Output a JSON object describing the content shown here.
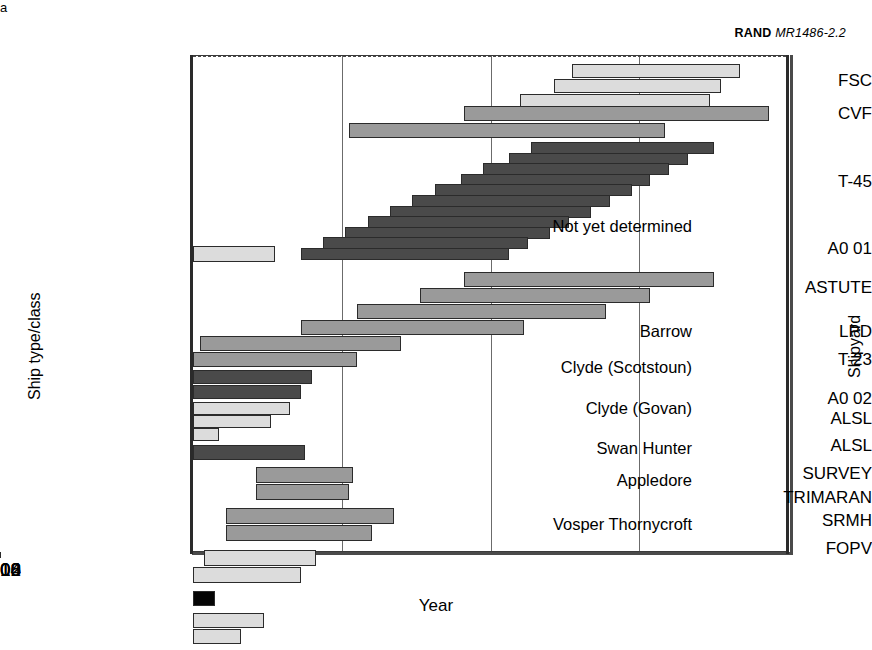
{
  "credit": {
    "org": "RAND",
    "doc": "MR1486-2.2"
  },
  "axes": {
    "x_title": "Year",
    "y_title_left": "Ship type/class",
    "y_title_right": "Shipyard",
    "x_ticks": [
      "2000",
      "2004",
      "2008",
      "2012",
      "2016"
    ],
    "x_min": 2000,
    "x_max": 2016
  },
  "footnote_marker": "a",
  "ship_classes": [
    "FSC",
    "CVF",
    "T-45",
    "A0 01",
    "ASTUTE",
    "LPD",
    "T-23",
    "A0 02",
    "ALSL",
    "ALSL",
    "SURVEY",
    "TRIMARAN",
    "SRMH",
    "FOPV"
  ],
  "shipyards": [
    "Not yet determined",
    "Barrow",
    "Clyde (Scotstoun)",
    "Clyde (Govan)",
    "Swan Hunter",
    "Appledore",
    "Vosper Thornycroft"
  ],
  "chart_data": {
    "type": "bar",
    "title": "RAND MR1486-2.2",
    "xlabel": "Year",
    "ylabel": "Ship type/class",
    "ylabel_right": "Shipyard",
    "xlim": [
      2000,
      2016
    ],
    "grid": "vertical at each 4-year tick",
    "legend": "none",
    "orientation": "horizontal-gantt",
    "note": "Each row is a ship class; individual bars are ship build programmes spanning start to finish year.",
    "rows": [
      {
        "label": "FSC",
        "shipyard": "Not yet determined",
        "fill": "light",
        "bars": [
          {
            "start": 2010.2,
            "end": 2014.7
          },
          {
            "start": 2009.7,
            "end": 2014.2
          },
          {
            "start": 2008.8,
            "end": 2013.9
          }
        ]
      },
      {
        "label": "CVF",
        "shipyard": "Not yet determined",
        "fill": "med",
        "bars": [
          {
            "start": 2007.3,
            "end": 2015.5
          },
          {
            "start": 2004.2,
            "end": 2012.7
          }
        ]
      },
      {
        "label": "T-45",
        "shipyard": "Not yet determined",
        "fill": "dark",
        "bars": [
          {
            "start": 2009.1,
            "end": 2014.0
          },
          {
            "start": 2008.5,
            "end": 2013.3
          },
          {
            "start": 2007.8,
            "end": 2012.8
          },
          {
            "start": 2007.2,
            "end": 2012.3
          },
          {
            "start": 2006.5,
            "end": 2011.8
          },
          {
            "start": 2005.9,
            "end": 2011.2
          },
          {
            "start": 2005.3,
            "end": 2010.7
          },
          {
            "start": 2004.7,
            "end": 2010.1
          },
          {
            "start": 2004.1,
            "end": 2009.6
          },
          {
            "start": 2003.5,
            "end": 2009.0
          },
          {
            "start": 2002.9,
            "end": 2008.5
          }
        ]
      },
      {
        "label": "A0 01",
        "shipyard": "Not yet determined",
        "fill": "light",
        "bars": [
          {
            "start": 2000.0,
            "end": 2002.2
          }
        ]
      },
      {
        "label": "ASTUTE",
        "shipyard": "Barrow",
        "fill": "med",
        "bars": [
          {
            "start": 2007.3,
            "end": 2014.0
          },
          {
            "start": 2006.1,
            "end": 2012.3
          },
          {
            "start": 2004.4,
            "end": 2011.1
          },
          {
            "start": 2002.9,
            "end": 2008.9
          },
          {
            "start": 2000.2,
            "end": 2005.6
          },
          {
            "start": 2000.0,
            "end": 2004.4
          }
        ]
      },
      {
        "label": "LPD",
        "shipyard": "Barrow",
        "fill": "dark",
        "bars": [
          {
            "start": 2000.0,
            "end": 2003.2
          },
          {
            "start": 2000.0,
            "end": 2002.9
          }
        ]
      },
      {
        "label": "T-23",
        "shipyard": "Clyde (Scotstoun)",
        "fill": "light",
        "bars": [
          {
            "start": 2000.0,
            "end": 2002.6
          },
          {
            "start": 2000.0,
            "end": 2002.1
          },
          {
            "start": 2000.0,
            "end": 2000.7
          }
        ]
      },
      {
        "label": "A0 02",
        "shipyard": "Clyde (Govan)",
        "fill": "dark",
        "bars": [
          {
            "start": 2000.0,
            "end": 2003.0
          }
        ]
      },
      {
        "label": "ALSL",
        "shipyard": "Clyde (Govan)",
        "fill": "med",
        "bars": [
          {
            "start": 2001.7,
            "end": 2004.3
          },
          {
            "start": 2001.7,
            "end": 2004.2
          }
        ]
      },
      {
        "label": "ALSL",
        "shipyard": "Swan Hunter",
        "fill": "med",
        "bars": [
          {
            "start": 2000.9,
            "end": 2005.4
          },
          {
            "start": 2000.9,
            "end": 2004.8
          }
        ]
      },
      {
        "label": "SURVEY",
        "shipyard": "Appledore",
        "fill": "light",
        "bars": [
          {
            "start": 2000.3,
            "end": 2003.3
          },
          {
            "start": 2000.0,
            "end": 2002.9
          }
        ]
      },
      {
        "label": "TRIMARAN",
        "shipyard": "Vosper Thornycroft",
        "fill": "black",
        "bars": [
          {
            "start": 2000.0,
            "end": 2000.6
          }
        ]
      },
      {
        "label": "SRMH",
        "shipyard": "Vosper Thornycroft",
        "fill": "light",
        "bars": [
          {
            "start": 2000.0,
            "end": 2001.9
          },
          {
            "start": 2000.0,
            "end": 2001.3
          }
        ]
      },
      {
        "label": "FOPV",
        "shipyard": "Vosper Thornycroft",
        "fill": "med",
        "bars": [
          {
            "start": 2001.6,
            "end": 2003.9
          },
          {
            "start": 2001.2,
            "end": 2003.4
          },
          {
            "start": 2000.7,
            "end": 2002.9
          }
        ]
      }
    ]
  },
  "layout": {
    "plot": {
      "left": 192,
      "top": 55,
      "width": 595,
      "height": 497
    },
    "px_per_year": 37.1875,
    "y_labels": [
      {
        "text": "FSC",
        "y": 72
      },
      {
        "text": "CVF",
        "y": 105
      },
      {
        "text": "T-45",
        "y": 173
      },
      {
        "text": "A0 01",
        "y": 240
      },
      {
        "text": "ASTUTE",
        "y": 279
      },
      {
        "text": "LPD",
        "y": 323
      },
      {
        "text": "T-23",
        "y": 351
      },
      {
        "text": "A0 02",
        "y": 390
      },
      {
        "text": "ALSL",
        "y": 410
      },
      {
        "text": "ALSL",
        "y": 437
      },
      {
        "text": "SURVEY",
        "y": 465
      },
      {
        "text": "TRIMARAN",
        "y": 489
      },
      {
        "text": "SRMH",
        "y": 512
      },
      {
        "text": "FOPV",
        "y": 540
      }
    ],
    "yard_labels": [
      {
        "text": "Not yet determined",
        "y": 218,
        "right": 180
      },
      {
        "text": "Barrow",
        "y": 323,
        "right": 180
      },
      {
        "text": "Clyde (Scotstoun)",
        "y": 359,
        "right": 180
      },
      {
        "text": "Clyde (Govan)",
        "y": 400,
        "right": 180
      },
      {
        "text": "Swan Hunter",
        "y": 440,
        "right": 180
      },
      {
        "text": "Appledore",
        "y": 472,
        "right": 180
      },
      {
        "text": "Vosper Thornycroft",
        "y": 516,
        "right": 180
      }
    ],
    "separators_y": [
      236,
      338,
      370,
      413,
      452,
      481
    ],
    "gridlines_x": [
      2004,
      2008,
      2012
    ]
  }
}
